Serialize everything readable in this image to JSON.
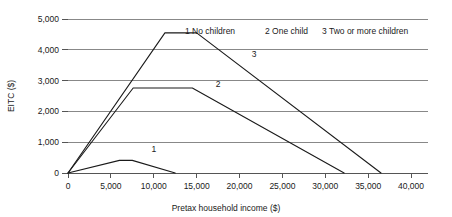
{
  "chart_data": {
    "type": "line",
    "title": "",
    "xlabel": "Pretax household income ($)",
    "ylabel": "EITC ($)",
    "xlim": [
      0,
      40000
    ],
    "ylim": [
      0,
      5000
    ],
    "grid": true,
    "legend_position": "top-right-inside",
    "xticks": [
      0,
      5000,
      10000,
      15000,
      20000,
      25000,
      30000,
      35000,
      40000
    ],
    "xtick_labels": [
      "0",
      "5,000",
      "10,000",
      "15,000",
      "20,000",
      "25,000",
      "30,000",
      "35,000",
      "40,000"
    ],
    "yticks": [
      0,
      1000,
      2000,
      3000,
      4000,
      5000
    ],
    "ytick_labels": [
      "0",
      "1,000",
      "2,000",
      "3,000",
      "4,000",
      "5,000"
    ],
    "series": [
      {
        "name": "1",
        "legend_label": "1 No children",
        "inline_label": "1",
        "inline_label_x": 10000,
        "inline_label_y": 680,
        "x": [
          0,
          6000,
          7500,
          12500
        ],
        "y": [
          0,
          410,
          410,
          0
        ]
      },
      {
        "name": "2",
        "legend_label": "2 One child",
        "inline_label": "2",
        "inline_label_x": 17500,
        "inline_label_y": 2790,
        "x": [
          0,
          7600,
          14500,
          32200
        ],
        "y": [
          0,
          2760,
          2760,
          0
        ]
      },
      {
        "name": "3",
        "legend_label": "3 Two or more children",
        "inline_label": "3",
        "inline_label_x": 21700,
        "inline_label_y": 3760,
        "x": [
          0,
          11300,
          15000,
          36500
        ],
        "y": [
          0,
          4550,
          4550,
          0
        ]
      }
    ],
    "legend_entries": [
      "1 No children",
      "2 One child",
      "3 Two or more children"
    ],
    "colors": {
      "line": "#1a1a1a",
      "grid": "#888888",
      "axis": "#555555",
      "text": "#1a1a1a",
      "background": "#ffffff"
    }
  }
}
